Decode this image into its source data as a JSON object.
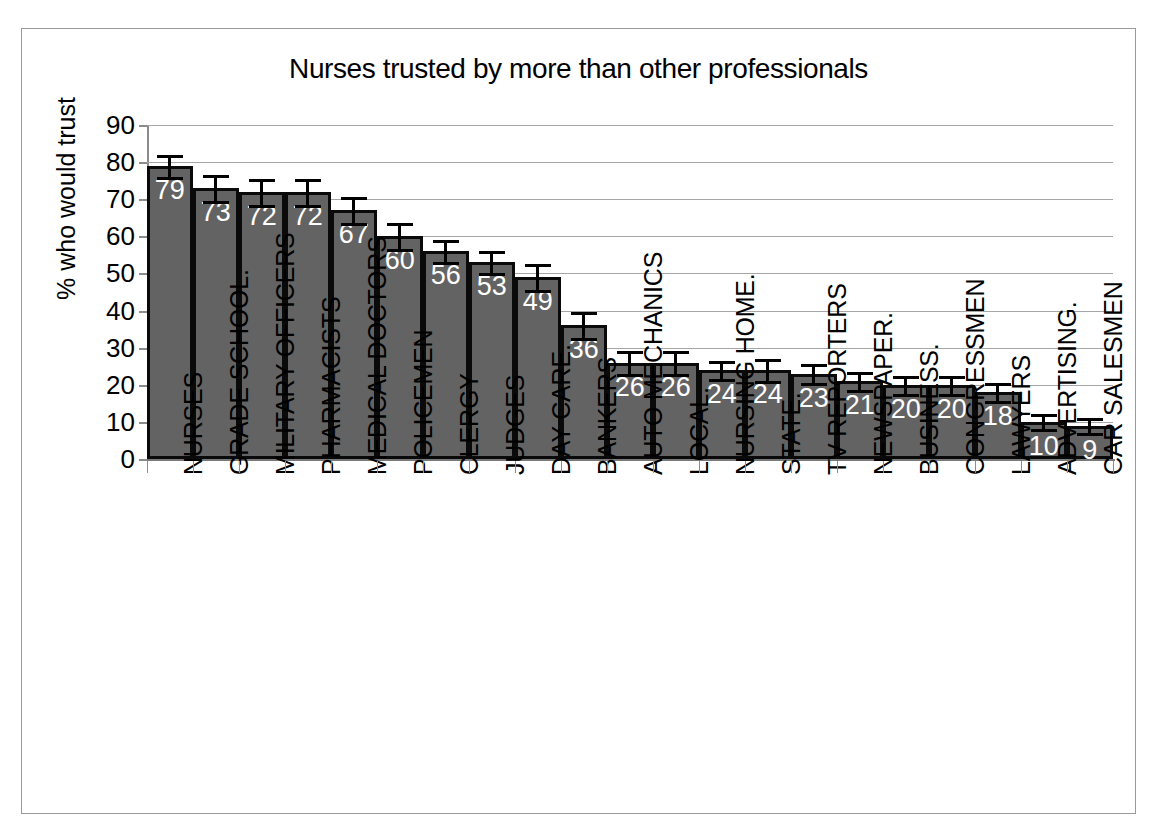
{
  "chart_data": {
    "type": "bar",
    "title": "Nurses trusted by more than other professionals",
    "xlabel": "",
    "ylabel": "% who would trust",
    "ylim": [
      0,
      90
    ],
    "ytick_labels": [
      "90",
      "80",
      "70",
      "60",
      "50",
      "40",
      "30",
      "20",
      "10",
      "0"
    ],
    "yticks": [
      90,
      80,
      70,
      60,
      50,
      40,
      30,
      20,
      10,
      0
    ],
    "grid": true,
    "legend": "none",
    "error_bars": true,
    "categories": [
      "NURSES",
      "GRADE SCHOOL.",
      "MILITARY OFFICERS",
      "PHARMACISTS",
      "MEDICAL DOCTORS",
      "POLICEMEN",
      "CLERGY",
      "JUDGES",
      "DAY CARE.",
      "BANKERS",
      "AUTO MECHANICS",
      "LOCAL.",
      "NURSING HOME.",
      "STATE.",
      "TV REPORTERS",
      "NEWSPAPER.",
      "BUSINESS.",
      "CONGRESSMEN",
      "LAWYERS",
      "ADVERTISING.",
      "CAR SALESMEN"
    ],
    "values": [
      79,
      73,
      72,
      72,
      67,
      60,
      56,
      53,
      49,
      36,
      26,
      26,
      24,
      24,
      23,
      21,
      20,
      20,
      18,
      10,
      9
    ],
    "value_labels": [
      "79",
      "73",
      "72",
      "72",
      "67",
      "60",
      "56",
      "53",
      "49",
      "36",
      "26",
      "26",
      "24",
      "24",
      "23",
      "21",
      "20",
      "20",
      "18",
      "10",
      "9"
    ],
    "errors": [
      3,
      3.5,
      3.5,
      3.5,
      3.5,
      3.5,
      3,
      3,
      3.5,
      3.5,
      3,
      3,
      2.5,
      3,
      2.5,
      2.5,
      2.5,
      2.5,
      2.5,
      2,
      2
    ],
    "colors": {
      "bar_fill": "#636363",
      "bar_edge": "#0a0a0a",
      "value_label": "#ffffff",
      "gridline": "#a6a6a6",
      "axis": "#8c8c8c",
      "text": "#000000",
      "background": "#ffffff",
      "frame_border": "#9a9a9a"
    }
  }
}
